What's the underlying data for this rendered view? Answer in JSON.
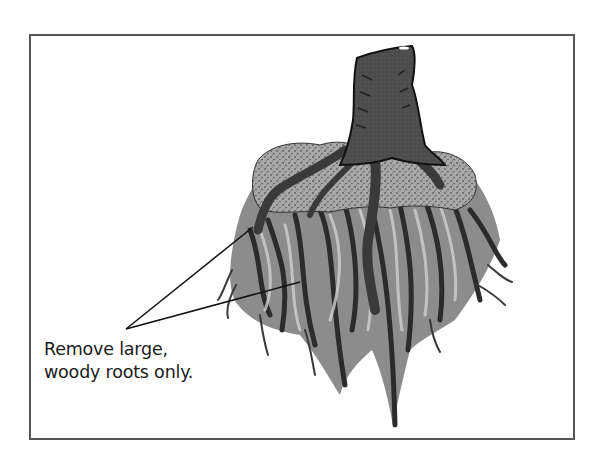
{
  "figure": {
    "caption_lines": [
      "Remove large,",
      "woody roots only."
    ],
    "callout_pointers": 2,
    "colors": {
      "border": "#555555",
      "stump": "#4a4a4a",
      "roots_dark": "#2e2e2e",
      "roots_mid": "#7a7a7a",
      "roots_light": "#c4c4c4",
      "soil": "#9a9a9a",
      "background": "#ffffff"
    }
  }
}
